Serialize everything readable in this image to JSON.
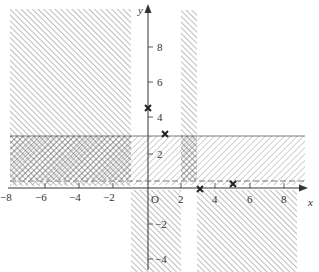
{
  "diagram": {
    "type": "inequality-regions",
    "axes": {
      "x_label": "x",
      "y_label": "y",
      "origin_label": "O",
      "x_ticks": [
        "−8",
        "−6",
        "−4",
        "−2",
        "2",
        "4",
        "6",
        "8"
      ],
      "y_ticks": [
        "8",
        "6",
        "4",
        "2",
        "−2",
        "−4"
      ]
    },
    "regions": [
      {
        "name": "top-left",
        "x": [
          -8,
          -1
        ],
        "y": [
          3,
          10
        ],
        "pattern": "hatch"
      },
      {
        "name": "band",
        "x": [
          -8,
          9.5
        ],
        "y": [
          0,
          3
        ],
        "pattern": "hatch-back"
      },
      {
        "name": "band-overlap-left",
        "x": [
          -8,
          -1
        ],
        "y": [
          0,
          3
        ],
        "pattern": "crosshatch"
      },
      {
        "name": "vertical-strip-top",
        "x": [
          2,
          3
        ],
        "y": [
          0,
          10
        ],
        "pattern": "hatch"
      },
      {
        "name": "bottom-strip",
        "x": [
          -1,
          2
        ],
        "y": [
          -4.5,
          0
        ],
        "pattern": "hatch"
      },
      {
        "name": "bottom-right",
        "x": [
          3,
          9
        ],
        "y": [
          -4.5,
          0
        ],
        "pattern": "hatch"
      }
    ],
    "points": [
      {
        "label": "cross-1",
        "x": 0,
        "y": 4.5
      },
      {
        "label": "cross-2",
        "x": 1,
        "y": 3
      },
      {
        "label": "cross-3",
        "x": 3,
        "y": 0
      },
      {
        "label": "cross-4",
        "x": 5,
        "y": 0.2
      }
    ],
    "colors": {
      "ink": "#333333",
      "hatch": "#777777",
      "background": "#ffffff"
    }
  }
}
